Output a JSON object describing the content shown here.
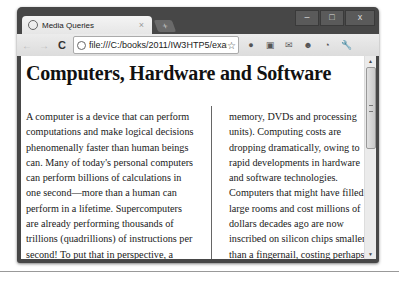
{
  "browser": {
    "tab": {
      "title": "Media Queries",
      "close": "×"
    },
    "new_tab": "+",
    "window_controls": {
      "minimize": "–",
      "maximize": "□",
      "close": "x"
    },
    "nav": {
      "back": "←",
      "forward": "→",
      "reload": "C"
    },
    "address_bar": {
      "url": "file:///C:/books/2011/IW3HTP5/exan",
      "star": "☆"
    },
    "extensions": [
      "●",
      "▣",
      "✉",
      "☻",
      "◔",
      "🔧"
    ]
  },
  "page": {
    "heading": "Computers, Hardware and Software",
    "column1": "A computer is a device that can perform computations and make logical decisions phenomenally faster than human beings can. Many of today's personal computers can perform billions of calculations in one second—more than a human can perform in a lifetime. Supercomputers are already performing thousands of trillions (quadrillions) of instructions per second! To put that in perspective, a quadrillion-instruction-per-second computer can perform in one second more than 100,000 calculations for every person on the planet!",
    "column2": "memory, DVDs and processing units). Computing costs are dropping dramatically, owing to rapid developments in hardware and software technologies. Computers that might have filled large rooms and cost millions of dollars decades ago are now inscribed on silicon chips smaller than a fingernail, costing perhaps a few dollars each. Ironically, silicon is one of the most abundant materials—it's an ingredient in common sand. Silicon-chip technology has made computing so economical that more than a billion"
  },
  "scrollbar": {
    "up": "▲",
    "down": "▼"
  }
}
